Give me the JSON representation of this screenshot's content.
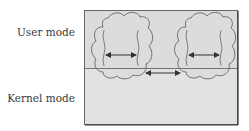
{
  "diagram": {
    "labels": {
      "user_mode": "User mode",
      "kernel_mode": "Kernel mode"
    },
    "colors": {
      "background_box": "#d9d9d9",
      "outline": "#555555",
      "arrow": "#333333"
    },
    "elements": {
      "processes": [
        {
          "name": "process-left",
          "threads": 2,
          "arrow": "bidirectional"
        },
        {
          "name": "process-right",
          "threads": 2,
          "arrow": "bidirectional"
        }
      ],
      "inter_process_arrow": "bidirectional"
    }
  }
}
